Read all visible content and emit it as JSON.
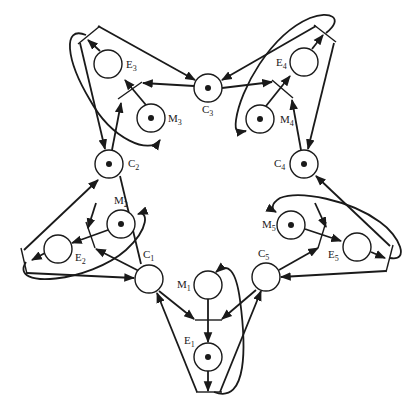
{
  "diagram": {
    "type": "petri-net",
    "places": [
      {
        "id": "C1",
        "label": "C",
        "sub": "1",
        "x": 149,
        "y": 279,
        "token": false
      },
      {
        "id": "C2",
        "label": "C",
        "sub": "2",
        "x": 109,
        "y": 164,
        "token": true
      },
      {
        "id": "C3",
        "label": "C",
        "sub": "3",
        "x": 208,
        "y": 88,
        "token": true
      },
      {
        "id": "C4",
        "label": "C",
        "sub": "4",
        "x": 304,
        "y": 164,
        "token": true
      },
      {
        "id": "C5",
        "label": "C",
        "sub": "5",
        "x": 266,
        "y": 277,
        "token": false
      },
      {
        "id": "E1",
        "label": "E",
        "sub": "1",
        "x": 208,
        "y": 357,
        "token": true
      },
      {
        "id": "E2",
        "label": "E",
        "sub": "2",
        "x": 58,
        "y": 249,
        "token": false
      },
      {
        "id": "E3",
        "label": "E",
        "sub": "3",
        "x": 108,
        "y": 64,
        "token": false
      },
      {
        "id": "E4",
        "label": "E",
        "sub": "4",
        "x": 304,
        "y": 62,
        "token": false
      },
      {
        "id": "E5",
        "label": "E",
        "sub": "5",
        "x": 357,
        "y": 247,
        "token": false
      },
      {
        "id": "M1",
        "label": "M",
        "sub": "1",
        "x": 208,
        "y": 285,
        "token": false
      },
      {
        "id": "M2",
        "label": "M",
        "sub": "2",
        "x": 121,
        "y": 224,
        "token": true
      },
      {
        "id": "M3",
        "label": "M",
        "sub": "3",
        "x": 151,
        "y": 118,
        "token": true
      },
      {
        "id": "M4",
        "label": "M",
        "sub": "4",
        "x": 260,
        "y": 119,
        "token": true
      },
      {
        "id": "M5",
        "label": "M",
        "sub": "5",
        "x": 291,
        "y": 225,
        "token": true
      }
    ],
    "colors": {
      "stroke": "#1a1a1a",
      "background": "#ffffff"
    }
  }
}
